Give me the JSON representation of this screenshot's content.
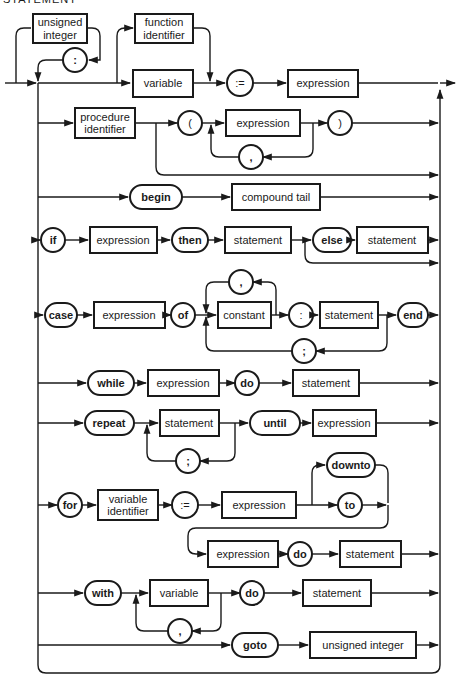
{
  "title": "STATEMENT",
  "colors": {
    "ink": "#1a1a1a",
    "background": "#ffffff"
  },
  "nonterminals": {
    "unsigned_integer_label": [
      "unsigned",
      "integer"
    ],
    "function_identifier": [
      "function",
      "identifier"
    ],
    "variable": "variable",
    "expression": "expression",
    "procedure_identifier": [
      "procedure",
      "identifier"
    ],
    "compound_tail": "compound tail",
    "statement": "statement",
    "constant": "constant",
    "variable_identifier": [
      "variable",
      "identifier"
    ],
    "unsigned_integer": "unsigned integer"
  },
  "terminals": {
    "colon": ":",
    "assign": ":=",
    "lparen": "(",
    "rparen": ")",
    "comma": ",",
    "semicolon": ";",
    "begin": "begin",
    "if": "if",
    "then": "then",
    "else": "else",
    "case": "case",
    "of": "of",
    "end": "end",
    "while": "while",
    "do": "do",
    "repeat": "repeat",
    "until": "until",
    "for": "for",
    "downto": "downto",
    "to": "to",
    "with": "with",
    "goto": "goto"
  },
  "rows": [
    {
      "id": "assignment",
      "items": [
        "unsigned integer",
        ":",
        "function identifier | variable",
        ":=",
        "expression"
      ]
    },
    {
      "id": "procedure-call",
      "items": [
        "procedure identifier",
        "(",
        "expression",
        ",",
        ")"
      ]
    },
    {
      "id": "compound",
      "items": [
        "begin",
        "compound tail"
      ]
    },
    {
      "id": "if",
      "items": [
        "if",
        "expression",
        "then",
        "statement",
        "else",
        "statement"
      ]
    },
    {
      "id": "case",
      "items": [
        "case",
        "expression",
        "of",
        "constant",
        ",",
        ":",
        "statement",
        ";",
        "end"
      ]
    },
    {
      "id": "while",
      "items": [
        "while",
        "expression",
        "do",
        "statement"
      ]
    },
    {
      "id": "repeat",
      "items": [
        "repeat",
        "statement",
        ";",
        "until",
        "expression"
      ]
    },
    {
      "id": "for",
      "items": [
        "for",
        "variable identifier",
        ":=",
        "expression",
        "downto",
        "to",
        "expression",
        "do",
        "statement"
      ]
    },
    {
      "id": "with",
      "items": [
        "with",
        "variable",
        ",",
        "do",
        "statement"
      ]
    },
    {
      "id": "goto",
      "items": [
        "goto",
        "unsigned integer"
      ]
    }
  ]
}
